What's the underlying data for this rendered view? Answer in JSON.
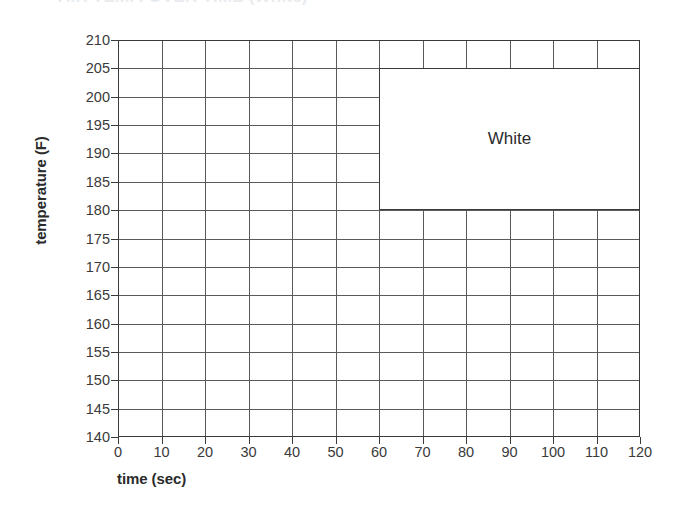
{
  "chart_data": {
    "type": "table",
    "title": "AIR TEMP. OVER TIME (White)",
    "xlabel": "time (sec)",
    "ylabel": "temperature (F)",
    "xlim": [
      0,
      120
    ],
    "ylim": [
      140,
      210
    ],
    "xticks": [
      0,
      10,
      20,
      30,
      40,
      50,
      60,
      70,
      80,
      90,
      100,
      110,
      120
    ],
    "yticks": [
      140,
      145,
      150,
      155,
      160,
      165,
      170,
      175,
      180,
      185,
      190,
      195,
      200,
      205,
      210
    ],
    "grid": true,
    "legend": "none",
    "series": [],
    "annotations": [
      {
        "label": "White",
        "shape": "rectangle",
        "x_start": 60,
        "x_end": 120,
        "y_start": 180,
        "y_end": 205,
        "fill": "#ffffff",
        "stroke": "#3a3a3a"
      }
    ],
    "colors": {
      "grid_line": "#5a5a5a",
      "axis_line": "#3a3a3a",
      "text": "#2b2b2b",
      "background": "#ffffff"
    }
  }
}
